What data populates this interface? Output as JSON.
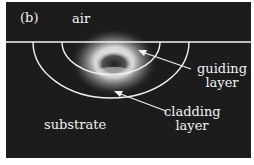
{
  "figure": {
    "panel_label": "(b)",
    "regions": {
      "air": "air",
      "substrate": "substrate"
    },
    "annotations": {
      "guiding_line1": "guiding",
      "guiding_line2": "layer",
      "cladding_line1": "cladding",
      "cladding_line2": "layer"
    },
    "colors": {
      "background": "#1c1c1c",
      "lines": "#f2f2f2",
      "text": "#f2f2f2"
    }
  }
}
